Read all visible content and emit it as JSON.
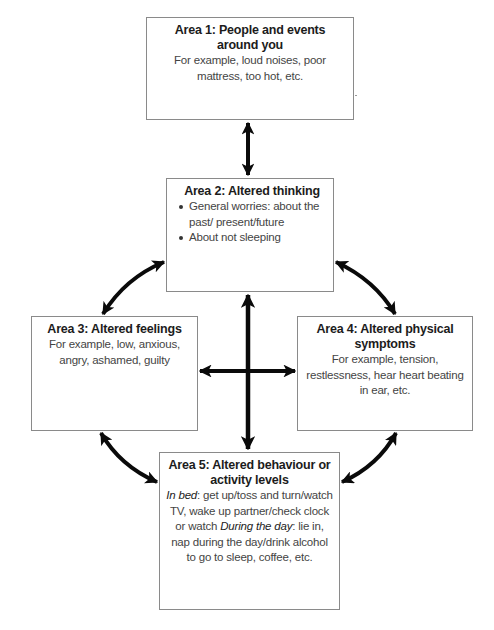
{
  "diagram": {
    "type": "five-areas-cycle",
    "areas": [
      {
        "id": 1,
        "title": "Area 1: People and events around you",
        "body": "For example, loud noises, poor mattress, too hot, etc."
      },
      {
        "id": 2,
        "title": "Area 2: Altered thinking",
        "bullets": [
          "General worries: about the past/ present/future",
          "About not sleeping"
        ]
      },
      {
        "id": 3,
        "title": "Area 3: Altered feelings",
        "body": "For example, low, anxious, angry, ashamed, guilty"
      },
      {
        "id": 4,
        "title": "Area 4: Altered physical symptoms",
        "body": "For example, tension, restlessness, hear heart beating in ear, etc."
      },
      {
        "id": 5,
        "title": "Area 5: Altered behaviour or activity levels",
        "sections": [
          {
            "label": "In bed",
            "text": ": get up/toss and turn/watch TV, wake up partner/check clock or watch"
          },
          {
            "label": "During the day",
            "text": ": lie in, nap during the day/drink alcohol to go to sleep, coffee, etc."
          }
        ]
      }
    ],
    "connections": [
      {
        "from": 1,
        "to": 2,
        "style": "double-arrow-straight"
      },
      {
        "from": 2,
        "to": 3,
        "style": "double-arrow-curved"
      },
      {
        "from": 2,
        "to": 4,
        "style": "double-arrow-curved"
      },
      {
        "from": 3,
        "to": 5,
        "style": "double-arrow-curved"
      },
      {
        "from": 4,
        "to": 5,
        "style": "double-arrow-curved"
      },
      {
        "from": 2,
        "to": 5,
        "style": "double-arrow-straight"
      },
      {
        "from": 3,
        "to": 4,
        "style": "double-arrow-straight"
      }
    ],
    "colors": {
      "arrow": "#0a0a0a",
      "box_border": "#8a8a8a",
      "title_text": "#1c1c1c",
      "body_text": "#444444"
    }
  }
}
